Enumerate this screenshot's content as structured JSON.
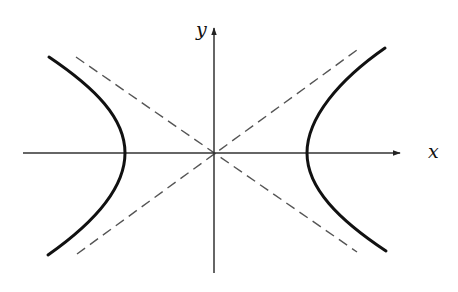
{
  "diagram": {
    "type": "hyperbola",
    "labels": {
      "x_axis": "x",
      "y_axis": "y"
    },
    "colors": {
      "curve": "#111111",
      "axes": "#333333",
      "asymptotes": "#555555",
      "background": "#ffffff"
    },
    "origin_px": [
      214,
      153
    ],
    "left_branch": {
      "vertex_px": [
        125,
        153
      ],
      "top_end_px": [
        49,
        57
      ],
      "bottom_end_px": [
        48,
        255
      ]
    },
    "right_branch": {
      "vertex_px": [
        307,
        153
      ],
      "top_end_px": [
        385,
        48
      ],
      "bottom_end_px": [
        386,
        251
      ]
    },
    "asymptotes": [
      {
        "from_px": [
          76,
          57
        ],
        "to_px": [
          357,
          252
        ],
        "style": "dashed"
      },
      {
        "from_px": [
          77,
          254
        ],
        "to_px": [
          357,
          50
        ],
        "style": "dashed"
      }
    ]
  }
}
